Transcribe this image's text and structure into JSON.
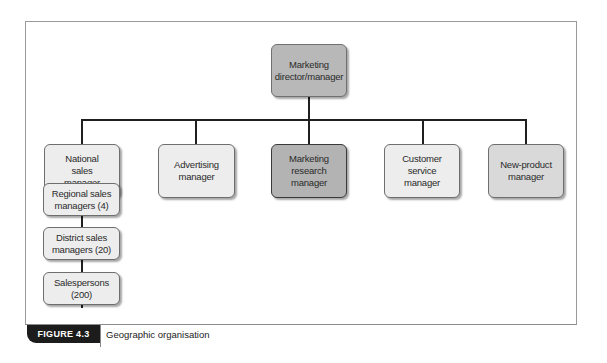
{
  "diagram": {
    "type": "org-chart",
    "root": {
      "label": "Marketing director/manager",
      "lines": [
        "Marketing",
        "director/manager"
      ]
    },
    "level2": [
      {
        "id": "national-sales",
        "lines": [
          "National",
          "sales",
          "manager"
        ]
      },
      {
        "id": "advertising",
        "lines": [
          "Advertising",
          "manager"
        ]
      },
      {
        "id": "marketing-research",
        "lines": [
          "Marketing",
          "research",
          "manager"
        ]
      },
      {
        "id": "customer-service",
        "lines": [
          "Customer",
          "service",
          "manager"
        ]
      },
      {
        "id": "new-product",
        "lines": [
          "New-product",
          "manager"
        ]
      }
    ],
    "sales_chain": [
      {
        "id": "regional",
        "lines": [
          "Regional sales",
          "managers (4)"
        ]
      },
      {
        "id": "district",
        "lines": [
          "District sales",
          "managers (20)"
        ]
      },
      {
        "id": "salespersons",
        "lines": [
          "Salespersons",
          "(200)"
        ]
      }
    ],
    "colors": {
      "root_fill": "#b3b3b3",
      "highlight_fill": "#b3b3b3",
      "box_fill": "#ededed",
      "alt_fill": "#d9d9d9",
      "connector": "#1f1f1f"
    }
  },
  "caption": {
    "figure_label": "FIGURE 4.3",
    "title": "Geographic organisation"
  }
}
